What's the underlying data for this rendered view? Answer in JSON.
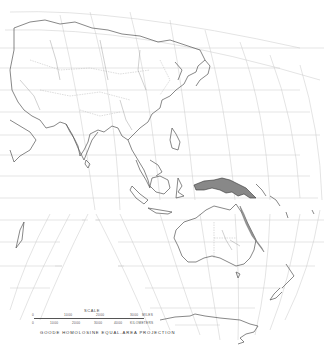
{
  "map": {
    "projection_label": "GOODE HOMOLOSINE EQUAL-AREA PROJECTION",
    "region": "Asia and Oceania",
    "highlighted_region": "New Guinea and northeastern Australia coastal strip",
    "colors": {
      "background": "#ffffff",
      "coastline": "#555555",
      "graticule": "#c8c8c8",
      "highlight_fill": "#888888"
    }
  },
  "scale": {
    "title": "SCALE",
    "miles": {
      "ticks": [
        "0",
        "1000",
        "2000",
        "3000"
      ],
      "unit": "MILES"
    },
    "kilometers": {
      "ticks": [
        "0",
        "1000",
        "2000",
        "3000",
        "4000"
      ],
      "unit": "KILOMETERS"
    }
  }
}
